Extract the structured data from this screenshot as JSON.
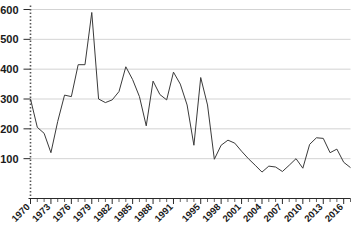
{
  "chart_data": {
    "type": "line",
    "title": "",
    "subtitle": "",
    "xlabel": "",
    "ylabel": "",
    "xlim": [
      1970,
      2017
    ],
    "ylim": [
      0,
      600
    ],
    "grid": true,
    "grid_axis": "y",
    "legend": false,
    "legend_position": "none",
    "line_color": "#3a3a3a",
    "grid_color": "#c8c8c8",
    "axis_color": "#2a2a2a",
    "background_color": "#ffffff",
    "y_ticks": [
      100,
      200,
      300,
      400,
      500,
      600
    ],
    "y_tick_labels": [
      "100",
      "200",
      "300",
      "400",
      "500",
      "600"
    ],
    "x_tick_labels": [
      "1970",
      "1973",
      "1976",
      "1979",
      "1982",
      "1985",
      "1988",
      "1991",
      "1995",
      "1998",
      "2001",
      "2004",
      "2007",
      "2010",
      "2013",
      "2016"
    ],
    "x_tick_label_values": [
      1970,
      1973,
      1976,
      1979,
      1982,
      1985,
      1988,
      1991,
      1995,
      1998,
      2001,
      2004,
      2007,
      2010,
      2013,
      2016
    ],
    "x_tick_label_rotation": 45,
    "x": [
      1970,
      1971,
      1972,
      1973,
      1974,
      1975,
      1976,
      1977,
      1978,
      1979,
      1980,
      1981,
      1982,
      1983,
      1984,
      1985,
      1986,
      1987,
      1988,
      1989,
      1990,
      1991,
      1992,
      1993,
      1994,
      1995,
      1996,
      1997,
      1998,
      1999,
      2000,
      2001,
      2002,
      2003,
      2004,
      2005,
      2006,
      2007,
      2008,
      2009,
      2010,
      2011,
      2012,
      2013,
      2014,
      2015,
      2016,
      2017
    ],
    "values": [
      300,
      205,
      185,
      120,
      225,
      313,
      308,
      415,
      415,
      590,
      300,
      288,
      297,
      325,
      408,
      365,
      308,
      210,
      360,
      315,
      297,
      390,
      350,
      280,
      145,
      372,
      280,
      98,
      145,
      162,
      152,
      125,
      100,
      78,
      55,
      75,
      72,
      57,
      78,
      100,
      68,
      148,
      170,
      168,
      120,
      132,
      88,
      70
    ],
    "series": [
      {
        "name": "series-1",
        "values": [
          300,
          205,
          185,
          120,
          225,
          313,
          308,
          415,
          415,
          590,
          300,
          288,
          297,
          325,
          408,
          365,
          308,
          210,
          360,
          315,
          297,
          390,
          350,
          280,
          145,
          372,
          280,
          98,
          145,
          162,
          152,
          125,
          100,
          78,
          55,
          75,
          72,
          57,
          78,
          100,
          68,
          148,
          170,
          168,
          120,
          132,
          88,
          70
        ]
      }
    ],
    "annotations": []
  }
}
